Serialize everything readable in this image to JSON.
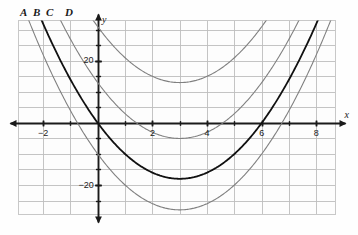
{
  "figure": {
    "background_color": "#fefefe",
    "grid_color": "#bdbdbd",
    "axis_color": "#1a1a1a",
    "plot_border_color": "#c8c8c8"
  },
  "axes": {
    "x_axis_label": "x",
    "y_axis_label": "y",
    "x_ticks": [
      {
        "value": -2,
        "label": "−2"
      },
      {
        "value": 2,
        "label": "2"
      },
      {
        "value": 4,
        "label": "4"
      },
      {
        "value": 6,
        "label": "6"
      },
      {
        "value": 8,
        "label": "8"
      }
    ],
    "y_ticks": [
      {
        "value": 20,
        "label": "20"
      },
      {
        "value": -20,
        "label": "−20"
      }
    ],
    "xlim": [
      -2.9,
      8.7
    ],
    "ylim": [
      -29.5,
      33.0
    ],
    "x_grid_step": 1,
    "y_grid_step": 5,
    "grid": true
  },
  "curve_labels": [
    {
      "id": "A",
      "label": "A",
      "x_px": 20,
      "y_px": 7
    },
    {
      "id": "B",
      "label": "B",
      "x_px": 33,
      "y_px": 7
    },
    {
      "id": "C",
      "label": "C",
      "x_px": 46,
      "y_px": 7
    },
    {
      "id": "D",
      "label": "D",
      "x_px": 65,
      "y_px": 7
    }
  ],
  "chart_data": {
    "type": "line",
    "xlabel": "x",
    "ylabel": "y",
    "xlim": [
      -2.9,
      8.7
    ],
    "ylim": [
      -29.5,
      33.0
    ],
    "grid": true,
    "legend": "curve letters A, B, C, D above top-left of plot",
    "series": [
      {
        "name": "A",
        "color": "#808080",
        "width": 1.1,
        "equation": "y = 2(x - 3)^2 - 28",
        "vertex": [
          3,
          -28
        ],
        "a": 2,
        "h": 3,
        "k": -28,
        "points": [
          {
            "x": -0.5,
            "y": -3.5
          },
          {
            "x": 0,
            "y": -10
          },
          {
            "x": 1,
            "y": -20
          },
          {
            "x": 2,
            "y": -26
          },
          {
            "x": 3,
            "y": -28
          },
          {
            "x": 4,
            "y": -26
          },
          {
            "x": 5,
            "y": -20
          },
          {
            "x": 6,
            "y": -10
          },
          {
            "x": 6.5,
            "y": -3.5
          }
        ]
      },
      {
        "name": "B",
        "color": "#111111",
        "width": 1.8,
        "equation": "y = 2(x - 3)^2 - 18",
        "vertex": [
          3,
          -18
        ],
        "a": 2,
        "h": 3,
        "k": -18,
        "points": [
          {
            "x": 0,
            "y": 0
          },
          {
            "x": 1,
            "y": -10
          },
          {
            "x": 2,
            "y": -16
          },
          {
            "x": 3,
            "y": -18
          },
          {
            "x": 4,
            "y": -16
          },
          {
            "x": 5,
            "y": -10
          },
          {
            "x": 6,
            "y": 0
          },
          {
            "x": 7,
            "y": 14
          }
        ]
      },
      {
        "name": "C",
        "color": "#808080",
        "width": 1.1,
        "equation": "y = 2(x - 3)^2 - 5",
        "vertex": [
          3,
          -5
        ],
        "a": 2,
        "h": 3,
        "k": -5,
        "points": [
          {
            "x": 1.4,
            "y": 0
          },
          {
            "x": 2,
            "y": -3
          },
          {
            "x": 3,
            "y": -5
          },
          {
            "x": 4,
            "y": -3
          },
          {
            "x": 4.6,
            "y": 0
          },
          {
            "x": 6,
            "y": 13
          },
          {
            "x": 7,
            "y": 27
          }
        ]
      },
      {
        "name": "D",
        "color": "#808080",
        "width": 1.1,
        "equation": "y = 2(x - 3)^2 + 13",
        "vertex": [
          3,
          13
        ],
        "a": 2,
        "h": 3,
        "k": 13,
        "points": [
          {
            "x": 0,
            "y": 31
          },
          {
            "x": 1,
            "y": 21
          },
          {
            "x": 2,
            "y": 15
          },
          {
            "x": 3,
            "y": 13
          },
          {
            "x": 4,
            "y": 15
          },
          {
            "x": 5,
            "y": 21
          },
          {
            "x": 6,
            "y": 31
          }
        ]
      }
    ]
  }
}
